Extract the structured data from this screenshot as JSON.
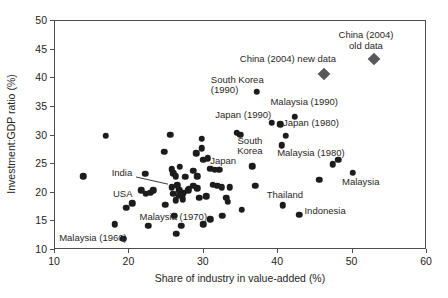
{
  "figure": {
    "background": "#ffffff",
    "dot_color": "#1c1c1c",
    "diamond_color": "#59595b",
    "axis_color": "#4d4d4d",
    "text_color": "#262424"
  },
  "chart_data": {
    "type": "scatter",
    "title": "",
    "xlabel": "Share of industry in value-added (%)",
    "ylabel": "Investment:GDP ratio (%)",
    "xlim": [
      10,
      60
    ],
    "ylim": [
      10,
      50
    ],
    "x_ticks": [
      10,
      20,
      30,
      40,
      50,
      60
    ],
    "y_ticks": [
      10,
      15,
      20,
      25,
      30,
      35,
      40,
      45,
      50
    ],
    "grid": false,
    "legend": "none",
    "series": [
      {
        "name": "country-observations",
        "marker": "circle",
        "color": "#1c1c1c",
        "points": [
          [
            13.8,
            22.9
          ],
          [
            16.8,
            30.0
          ],
          [
            18.0,
            14.5
          ],
          [
            19.2,
            12.0
          ],
          [
            19.6,
            17.4
          ],
          [
            20.4,
            18.2
          ],
          [
            21.6,
            20.4
          ],
          [
            22.2,
            19.8
          ],
          [
            22.8,
            20.0
          ],
          [
            23.2,
            20.4
          ],
          [
            22.1,
            23.3
          ],
          [
            22.5,
            14.2
          ],
          [
            24.7,
            27.2
          ],
          [
            25.5,
            30.1
          ],
          [
            24.8,
            17.9
          ],
          [
            25.7,
            24.1
          ],
          [
            25.9,
            23.4
          ],
          [
            26.2,
            22.9
          ],
          [
            25.7,
            21.0
          ],
          [
            26.4,
            21.3
          ],
          [
            26.7,
            20.4
          ],
          [
            25.9,
            19.8
          ],
          [
            26.6,
            19.5
          ],
          [
            27.3,
            20.0
          ],
          [
            27.9,
            20.4
          ],
          [
            26.2,
            18.7
          ],
          [
            26.0,
            16.0
          ],
          [
            26.3,
            12.8
          ],
          [
            27.0,
            14.2
          ],
          [
            26.8,
            24.5
          ],
          [
            27.5,
            22.8
          ],
          [
            27.2,
            19.7
          ],
          [
            27.2,
            18.9
          ],
          [
            28.0,
            20.7
          ],
          [
            28.6,
            21.2
          ],
          [
            28.6,
            23.8
          ],
          [
            29.1,
            22.9
          ],
          [
            29.1,
            20.8
          ],
          [
            29.4,
            19.1
          ],
          [
            29.7,
            29.4
          ],
          [
            29.7,
            27.8
          ],
          [
            29.0,
            26.9
          ],
          [
            29.9,
            25.8
          ],
          [
            30.5,
            26.0
          ],
          [
            30.3,
            19.4
          ],
          [
            29.9,
            14.5
          ],
          [
            30.9,
            15.4
          ],
          [
            30.9,
            24.2
          ],
          [
            31.5,
            24.0
          ],
          [
            32.1,
            24.0
          ],
          [
            31.2,
            21.4
          ],
          [
            31.8,
            21.2
          ],
          [
            32.4,
            21.0
          ],
          [
            33.5,
            21.0
          ],
          [
            33.0,
            19.1
          ],
          [
            33.2,
            18.4
          ],
          [
            32.5,
            16.0
          ],
          [
            35.1,
            17.0
          ],
          [
            34.4,
            30.5
          ],
          [
            34.9,
            30.1
          ],
          [
            36.5,
            24.6
          ],
          [
            36.9,
            21.2
          ],
          [
            37.1,
            37.6
          ],
          [
            39.1,
            32.2
          ],
          [
            40.3,
            32.0
          ],
          [
            41.0,
            30.0
          ],
          [
            40.5,
            28.3
          ],
          [
            42.2,
            33.3
          ],
          [
            40.6,
            17.8
          ],
          [
            42.8,
            16.2
          ],
          [
            45.5,
            22.3
          ],
          [
            47.3,
            25.0
          ],
          [
            48.1,
            25.8
          ],
          [
            50.0,
            23.5
          ]
        ]
      },
      {
        "name": "china-2004",
        "marker": "diamond",
        "color": "#59595b",
        "points": [
          [
            46.1,
            40.7
          ],
          [
            52.9,
            43.3
          ]
        ]
      }
    ],
    "annotations": [
      {
        "text": "China (2004) old data",
        "x": 51.8,
        "y": 46.6,
        "align": "center"
      },
      {
        "text": "China (2004) new data",
        "x": 41.3,
        "y": 43.4,
        "align": "center"
      },
      {
        "text": "South Korea\n(1990)",
        "x": 34.5,
        "y": 38.9,
        "align": "left"
      },
      {
        "text": "Malaysia (1990)",
        "x": 43.5,
        "y": 35.8,
        "align": "center"
      },
      {
        "text": "Japan (1990)",
        "x": 35.3,
        "y": 33.5,
        "align": "center"
      },
      {
        "text": "Japan (1980)",
        "x": 44.4,
        "y": 32.1,
        "align": "center"
      },
      {
        "text": "Malaysia (1980)",
        "x": 44.4,
        "y": 26.9,
        "align": "center"
      },
      {
        "text": "South\nKorea",
        "x": 36.2,
        "y": 28.2,
        "align": "center"
      },
      {
        "text": "Japan",
        "x": 32.6,
        "y": 25.6,
        "align": "center"
      },
      {
        "text": "Malaysia",
        "x": 51.1,
        "y": 21.9,
        "align": "center"
      },
      {
        "text": "Thailand",
        "x": 40.9,
        "y": 19.6,
        "align": "center"
      },
      {
        "text": "Indonesia",
        "x": 46.3,
        "y": 16.8,
        "align": "center"
      },
      {
        "text": "India",
        "x": 19.0,
        "y": 23.4,
        "align": "center"
      },
      {
        "text": "USA",
        "x": 19.1,
        "y": 19.7,
        "align": "center"
      },
      {
        "text": "Malaysia (1970)",
        "x": 25.9,
        "y": 15.7,
        "align": "center"
      },
      {
        "text": "Malaysia (1960)",
        "x": 15.1,
        "y": 12.1,
        "align": "center"
      }
    ],
    "callout_line": {
      "from": [
        20.9,
        22.75
      ],
      "to": [
        25.2,
        21.5
      ]
    }
  }
}
